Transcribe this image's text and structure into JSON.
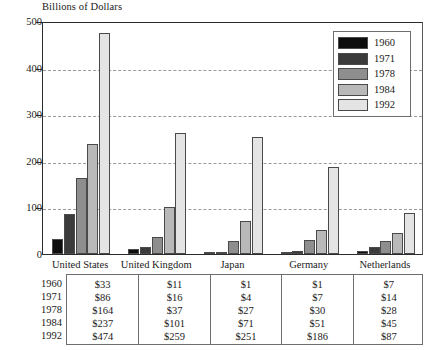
{
  "chart_data": {
    "type": "bar",
    "title": "Billions of Dollars",
    "xlabel": "",
    "ylabel": "",
    "ylim": [
      0,
      500
    ],
    "yticks": [
      "0",
      "100",
      "200",
      "300",
      "400",
      "500"
    ],
    "grid": true,
    "legend_position": "top-right",
    "categories": [
      "United States",
      "United Kingdom",
      "Japan",
      "Germany",
      "Netherlands"
    ],
    "series": [
      {
        "name": "1960",
        "color": "#0d0d0d",
        "values": [
          33,
          11,
          1,
          1,
          7
        ]
      },
      {
        "name": "1971",
        "color": "#3b3b3b",
        "values": [
          86,
          16,
          4,
          7,
          14
        ]
      },
      {
        "name": "1978",
        "color": "#8e8e8e",
        "values": [
          164,
          37,
          27,
          30,
          28
        ]
      },
      {
        "name": "1984",
        "color": "#b9b9b9",
        "values": [
          237,
          101,
          71,
          51,
          45
        ]
      },
      {
        "name": "1992",
        "color": "#e4e4e4",
        "values": [
          474,
          259,
          251,
          186,
          87
        ]
      }
    ]
  },
  "legend": {
    "items": [
      {
        "label": "1960",
        "color": "#0d0d0d"
      },
      {
        "label": "1971",
        "color": "#3b3b3b"
      },
      {
        "label": "1978",
        "color": "#8e8e8e"
      },
      {
        "label": "1984",
        "color": "#b9b9b9"
      },
      {
        "label": "1992",
        "color": "#e4e4e4"
      }
    ]
  },
  "table": {
    "row_labels": [
      "1960",
      "1971",
      "1978",
      "1984",
      "1992"
    ],
    "columns": [
      "United States",
      "United Kingdom",
      "Japan",
      "Germany",
      "Netherlands"
    ],
    "cells": [
      [
        "$33",
        "$11",
        "$1",
        "$1",
        "$7"
      ],
      [
        "$86",
        "$16",
        "$4",
        "$7",
        "$14"
      ],
      [
        "$164",
        "$37",
        "$27",
        "$30",
        "$28"
      ],
      [
        "$237",
        "$101",
        "$71",
        "$51",
        "$45"
      ],
      [
        "$474",
        "$259",
        "$251",
        "$186",
        "$87"
      ]
    ]
  }
}
